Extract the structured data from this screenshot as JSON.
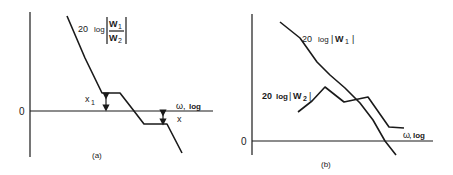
{
  "panel_a": {
    "caption": "(a)",
    "zero_label": "0",
    "curve_label": {
      "prefix": "20",
      "log": "log",
      "num": "W",
      "num_sub": "1",
      "den": "W",
      "den_sub": "2"
    },
    "x_axis_label": {
      "omega": "ω",
      "sep": ",",
      "log": "log"
    },
    "arrow_labels": {
      "x1": "x",
      "x1_sub": "1",
      "x": "x"
    },
    "curve_points": [
      [
        67,
        16
      ],
      [
        85,
        58
      ],
      [
        102,
        93
      ],
      [
        120,
        93
      ],
      [
        134,
        111
      ],
      [
        144,
        124
      ],
      [
        167,
        124
      ],
      [
        182,
        153
      ]
    ]
  },
  "panel_b": {
    "caption": "(b)",
    "zero_label": "0",
    "w1_label": {
      "prefix": "20",
      "log": "log",
      "bar": "|",
      "var": "W",
      "sub": "1",
      "bar_end": "|"
    },
    "w2_label": {
      "prefix": "20",
      "log": "log",
      "bar": "|",
      "var": "W",
      "sub": "2",
      "bar_end": "|"
    },
    "x_axis_label": {
      "omega": "ω",
      "sep": ",",
      "log": "log"
    },
    "w1_points": [
      [
        280,
        22
      ],
      [
        300,
        38
      ],
      [
        317,
        62
      ],
      [
        330,
        75
      ],
      [
        345,
        88
      ],
      [
        360,
        103
      ],
      [
        373,
        120
      ],
      [
        385,
        141
      ],
      [
        396,
        155
      ]
    ],
    "w2_points": [
      [
        298,
        112
      ],
      [
        312,
        101
      ],
      [
        325,
        87
      ],
      [
        344,
        102
      ],
      [
        368,
        97
      ],
      [
        389,
        127
      ],
      [
        404,
        128
      ]
    ]
  }
}
